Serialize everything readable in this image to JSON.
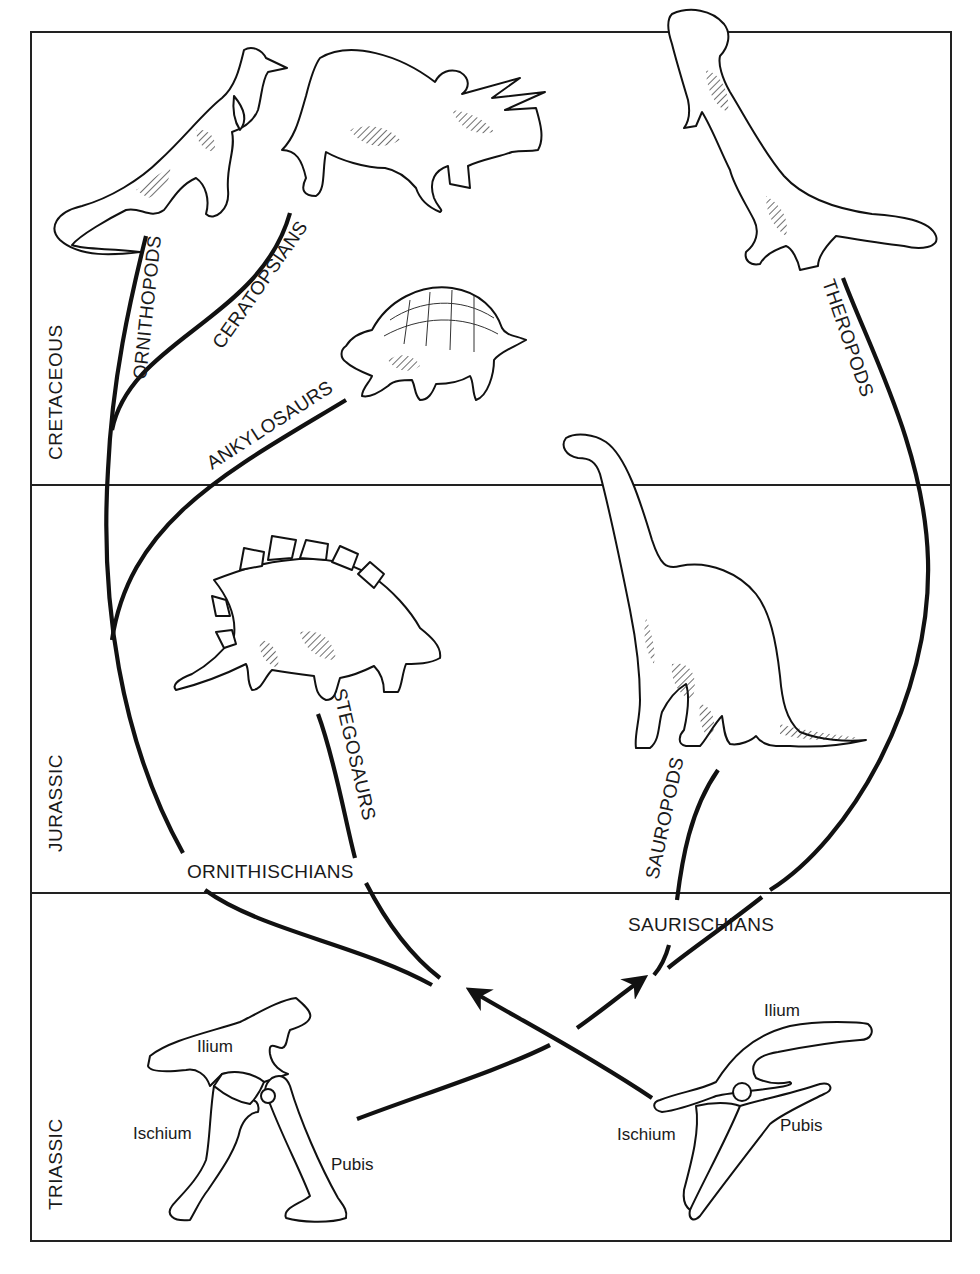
{
  "figure": {
    "type": "phylogenetic-diagram"
  },
  "periods": [
    {
      "id": "cretaceous",
      "label": "CRETACEOUS"
    },
    {
      "id": "jurassic",
      "label": "JURASSIC"
    },
    {
      "id": "triassic",
      "label": "TRIASSIC"
    }
  ],
  "groups": {
    "ornithischians": "ORNITHISCHIANS",
    "saurischians": "SAURISCHIANS"
  },
  "lineages": {
    "ornithopods": "ORNITHOPODS",
    "ceratopsians": "CERATOPSIANS",
    "ankylosaurs": "ANKYLOSAURS",
    "stegosaurs": "STEGOSAURS",
    "sauropods": "SAUROPODS",
    "theropods": "THEROPODS"
  },
  "pelvis_left": {
    "name": "ornithischian-hip",
    "labels": {
      "ilium": "Ilium",
      "ischium": "Ischium",
      "pubis": "Pubis"
    }
  },
  "pelvis_right": {
    "name": "saurischian-hip",
    "labels": {
      "ilium": "Ilium",
      "ischium": "Ischium",
      "pubis": "Pubis"
    }
  },
  "colors": {
    "ink": "#111111",
    "paper": "#ffffff"
  }
}
